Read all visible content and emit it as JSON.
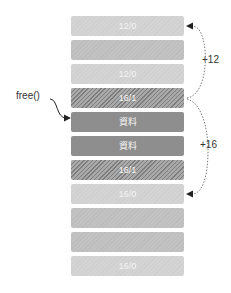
{
  "diagram": {
    "blocks": [
      {
        "label": "12/0",
        "style": "light"
      },
      {
        "label": "",
        "style": "mid"
      },
      {
        "label": "12/0",
        "style": "light"
      },
      {
        "label": "16/1",
        "style": "hatch"
      },
      {
        "label": "資料",
        "style": "dark"
      },
      {
        "label": "資料",
        "style": "dark"
      },
      {
        "label": "16/1",
        "style": "hatch"
      },
      {
        "label": "16/0",
        "style": "light"
      },
      {
        "label": "",
        "style": "mid"
      },
      {
        "label": "",
        "style": "mid"
      },
      {
        "label": "16/0",
        "style": "light"
      }
    ],
    "free_label": "free()",
    "offset_up": "+12",
    "offset_down": "+16"
  }
}
